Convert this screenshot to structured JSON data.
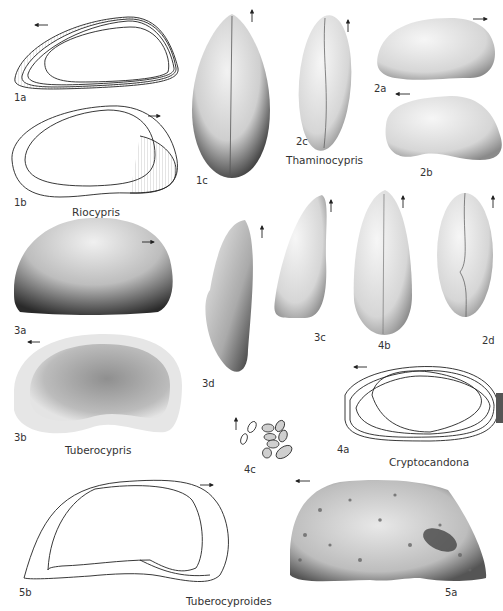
{
  "plate": {
    "genera": [
      {
        "name": "Riocypris",
        "figures": [
          "1a",
          "1b",
          "1c"
        ]
      },
      {
        "name": "Thaminocypris",
        "figures": [
          "2a",
          "2b",
          "2c"
        ]
      },
      {
        "name": "Tuberocypris",
        "figures": [
          "3a",
          "3b",
          "3c",
          "3d"
        ]
      },
      {
        "name": "Cryptocandona",
        "figures": [
          "4a",
          "4b",
          "4c",
          "2d"
        ]
      },
      {
        "name": "Tuberocyproides",
        "figures": [
          "5a",
          "5b"
        ]
      }
    ],
    "labels": {
      "f1a": "1a",
      "f1b": "1b",
      "f1c": "1c",
      "f2a": "2a",
      "f2b": "2b",
      "f2c": "2c",
      "f2d": "2d",
      "f3a": "3a",
      "f3b": "3b",
      "f3c": "3c",
      "f3d": "3d",
      "f4a": "4a",
      "f4b": "4b",
      "f4c": "4c",
      "f5a": "5a",
      "f5b": "5b"
    },
    "genus_names": {
      "riocypris": "Riocypris",
      "thaminocypris": "Thaminocypris",
      "tuberocypris": "Tuberocypris",
      "cryptocandona": "Cryptocandona",
      "tuberocyproides": "Tuberocyproides"
    }
  }
}
